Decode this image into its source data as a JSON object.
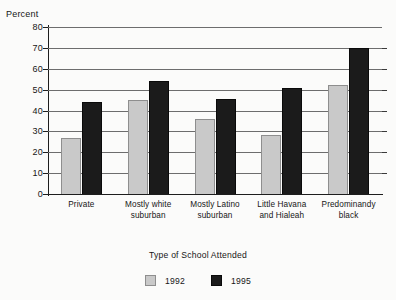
{
  "chart_data": {
    "type": "bar",
    "title": "",
    "xlabel": "Type of School Attended",
    "ylabel": "Percent",
    "ylim": [
      0,
      80
    ],
    "yticks": [
      0,
      10,
      20,
      30,
      40,
      50,
      60,
      70,
      80
    ],
    "ytick_labels": [
      "0",
      "10",
      "20",
      "30",
      "40",
      "50",
      "60",
      "70",
      "80"
    ],
    "grid": true,
    "legend_position": "bottom-center",
    "categories": [
      "Private",
      "Mostly white suburban",
      "Mostly Latino suburban",
      "Little Havana and Hialeah",
      "Predominantly black"
    ],
    "category_lines": [
      [
        "Private"
      ],
      [
        "Mostly white",
        "suburban"
      ],
      [
        "Mostly Latino",
        "suburban"
      ],
      [
        "Little Havana",
        "and Hialeah"
      ],
      [
        "Predominandy",
        "black"
      ]
    ],
    "series": [
      {
        "name": "1992",
        "color": "#c9c9c9",
        "values": [
          27,
          45,
          36,
          28.5,
          52
        ]
      },
      {
        "name": "1995",
        "color": "#1b1b1b",
        "values": [
          44,
          54,
          45.5,
          51,
          70
        ]
      }
    ]
  },
  "legend": {
    "items": [
      {
        "label": "1992",
        "color": "#c9c9c9"
      },
      {
        "label": "1995",
        "color": "#1b1b1b"
      }
    ]
  },
  "colors": {
    "bar_1992": "#c9c9c9",
    "bar_1992_edge": "#8e8e8e",
    "bar_1995": "#1b1b1b",
    "axis": "#1d1d1d",
    "gridline": "#6d6d6d",
    "background": "#fbfbfa",
    "text": "#161616"
  }
}
